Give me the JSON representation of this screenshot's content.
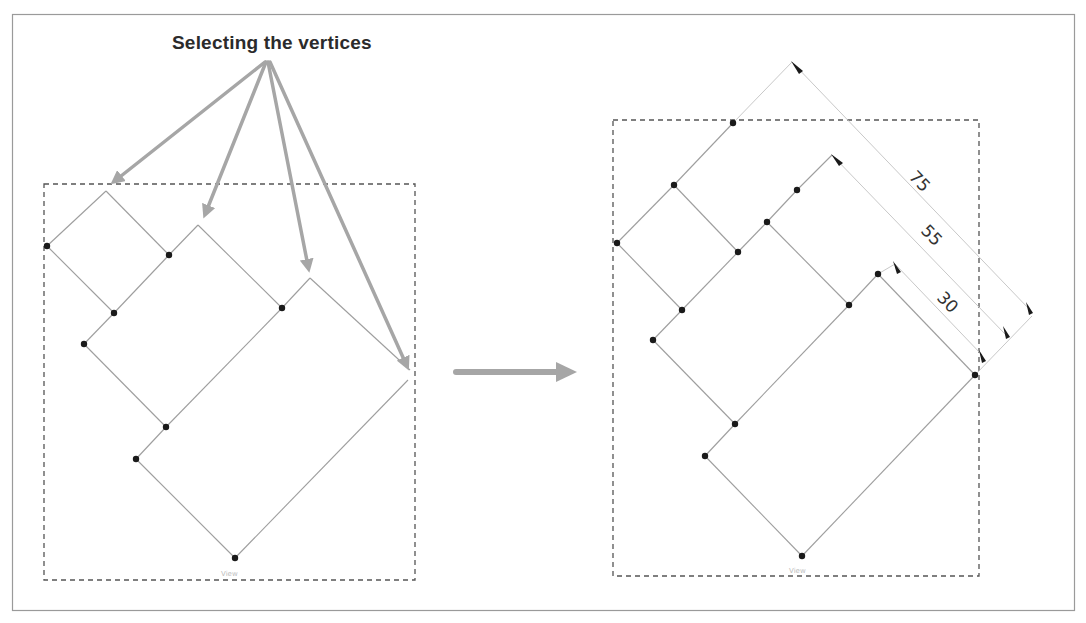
{
  "figure": {
    "title": "Selecting the vertices",
    "colors": {
      "frame": "#9a9a9a",
      "dashed_border": "#555555",
      "edge": "#9e9e9e",
      "vertex": "#1a1a1a",
      "callout_arrow": "#a6a6a6",
      "dimension_line": "#c8c8c8",
      "dimension_tick": "#1a1a1a"
    }
  },
  "left_view": {
    "label": "View",
    "description": "Before: outline with selected vertices",
    "callout_targets": 4
  },
  "transition_arrow": {
    "direction": "right"
  },
  "right_view": {
    "label": "View",
    "description": "After: vertices offset by dimensions",
    "dimensions": [
      {
        "value": "75"
      },
      {
        "value": "55"
      },
      {
        "value": "30"
      }
    ]
  }
}
